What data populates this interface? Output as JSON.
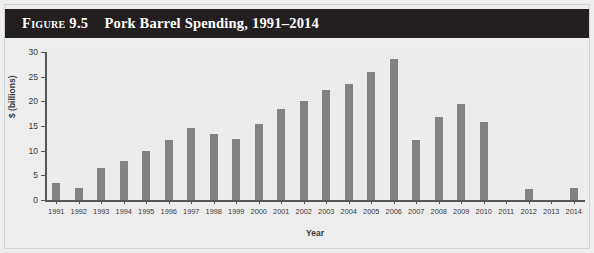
{
  "figure": {
    "number_label": "Figure 9.5",
    "title": "Pork Barrel Spending, 1991–2014",
    "banner_color": "#231f20",
    "page_background": "#ededed"
  },
  "chart_data": {
    "type": "bar",
    "title": "Pork Barrel Spending, 1991–2014",
    "xlabel": "Year",
    "ylabel": "$ (billions)",
    "ylim": [
      0,
      30
    ],
    "ytick_labels": [
      "0",
      "5",
      "10",
      "15",
      "20",
      "25",
      "30"
    ],
    "yticks": [
      0,
      5,
      10,
      15,
      20,
      25,
      30
    ],
    "grid": false,
    "legend": null,
    "bar_color": "#808284",
    "plot_background": "#ececec",
    "categories": [
      "1991",
      "1992",
      "1993",
      "1994",
      "1995",
      "1996",
      "1997",
      "1998",
      "1999",
      "2000",
      "2001",
      "2002",
      "2003",
      "2004",
      "2005",
      "2006",
      "2007",
      "2008",
      "2009",
      "2010",
      "2011",
      "2012",
      "2013",
      "2014"
    ],
    "values": [
      3.5,
      2.5,
      6.5,
      8.0,
      10.0,
      12.2,
      14.5,
      13.3,
      12.3,
      15.5,
      18.5,
      20.0,
      22.3,
      23.5,
      26.0,
      28.5,
      12.2,
      16.8,
      19.5,
      15.8,
      0,
      2.2,
      0,
      2.5
    ]
  }
}
